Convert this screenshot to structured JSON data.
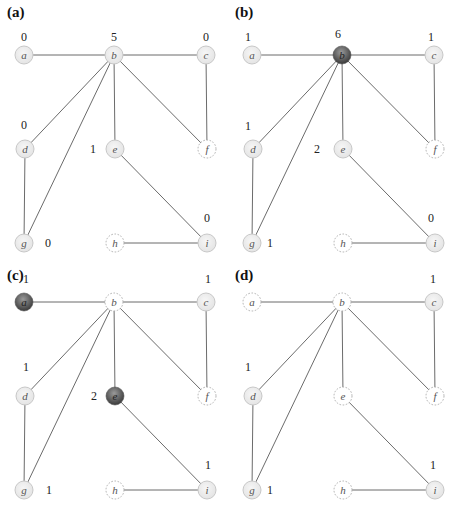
{
  "figure": {
    "node_positions": {
      "a": [
        24,
        55
      ],
      "b": [
        114,
        55
      ],
      "c": [
        206,
        55
      ],
      "d": [
        25,
        149
      ],
      "e": [
        115,
        149
      ],
      "f": [
        207,
        149
      ],
      "g": [
        24,
        243
      ],
      "h": [
        115,
        243
      ],
      "i": [
        207,
        243
      ]
    },
    "edges": [
      [
        "a",
        "b"
      ],
      [
        "b",
        "c"
      ],
      [
        "b",
        "d"
      ],
      [
        "b",
        "g"
      ],
      [
        "b",
        "e"
      ],
      [
        "b",
        "f"
      ],
      [
        "c",
        "f"
      ],
      [
        "d",
        "g"
      ],
      [
        "e",
        "i"
      ],
      [
        "h",
        "i"
      ]
    ],
    "colors": {
      "edge": "#6b6b6b",
      "node_light_fill": "#e4e4e4",
      "node_light_stroke": "#c8c8c8",
      "node_dark_center": "#9a9a9a",
      "node_dark_edge": "#3a3a3a",
      "node_removed_stroke": "#b0b0b0",
      "label_text": "#555555"
    }
  },
  "panels": [
    {
      "label": "(a)",
      "nodes": {
        "a": "light",
        "b": "light",
        "c": "light",
        "d": "light",
        "e": "light",
        "f": "removed",
        "g": "light",
        "h": "removed",
        "i": "light"
      },
      "counts": [
        {
          "node": "a",
          "text": "0",
          "x": 24,
          "y": 37
        },
        {
          "node": "b",
          "text": "5",
          "x": 114,
          "y": 37
        },
        {
          "node": "c",
          "text": "0",
          "x": 206,
          "y": 37
        },
        {
          "node": "d",
          "text": "0",
          "x": 24,
          "y": 125
        },
        {
          "node": "e",
          "text": "1",
          "x": 93,
          "y": 149
        },
        {
          "node": "i",
          "text": "0",
          "x": 207,
          "y": 218
        },
        {
          "node": "g",
          "text": "0",
          "x": 48,
          "y": 243
        }
      ]
    },
    {
      "label": "(b)",
      "nodes": {
        "a": "light",
        "b": "dark",
        "c": "light",
        "d": "light",
        "e": "light",
        "f": "removed",
        "g": "light",
        "h": "removed",
        "i": "light"
      },
      "counts": [
        {
          "node": "a",
          "text": "1",
          "x": 20,
          "y": 37
        },
        {
          "node": "b",
          "text": "6",
          "x": 110,
          "y": 34
        },
        {
          "node": "c",
          "text": "1",
          "x": 203,
          "y": 37
        },
        {
          "node": "d",
          "text": "1",
          "x": 20,
          "y": 126
        },
        {
          "node": "e",
          "text": "2",
          "x": 89,
          "y": 149
        },
        {
          "node": "i",
          "text": "0",
          "x": 203,
          "y": 218
        },
        {
          "node": "g",
          "text": "1",
          "x": 42,
          "y": 243
        }
      ]
    },
    {
      "label": "(c)",
      "nodes": {
        "a": "dark",
        "b": "removed",
        "c": "light",
        "d": "light",
        "e": "dark",
        "f": "removed",
        "g": "light",
        "h": "removed",
        "i": "light"
      },
      "counts": [
        {
          "node": "a",
          "text": "1",
          "x": 26,
          "y": 32
        },
        {
          "node": "c",
          "text": "1",
          "x": 208,
          "y": 32
        },
        {
          "node": "d",
          "text": "1",
          "x": 26,
          "y": 120
        },
        {
          "node": "e",
          "text": "2",
          "x": 94,
          "y": 149
        },
        {
          "node": "i",
          "text": "1",
          "x": 208,
          "y": 218
        },
        {
          "node": "g",
          "text": "1",
          "x": 49,
          "y": 243
        }
      ]
    },
    {
      "label": "(d)",
      "nodes": {
        "a": "removed",
        "b": "removed",
        "c": "light",
        "d": "light",
        "e": "removed",
        "f": "removed",
        "g": "light",
        "h": "removed",
        "i": "light"
      },
      "counts": [
        {
          "node": "c",
          "text": "1",
          "x": 205,
          "y": 32
        },
        {
          "node": "d",
          "text": "1",
          "x": 20,
          "y": 120
        },
        {
          "node": "i",
          "text": "1",
          "x": 205,
          "y": 218
        },
        {
          "node": "g",
          "text": "1",
          "x": 42,
          "y": 243
        }
      ]
    }
  ]
}
